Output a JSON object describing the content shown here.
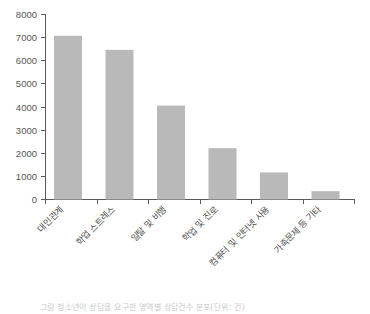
{
  "chart_data": {
    "type": "bar",
    "title": "",
    "subtitle": "",
    "xlabel": "",
    "ylabel": "",
    "ylim": [
      0,
      8000
    ],
    "ytick_labels": [
      "8000",
      "7000",
      "6000",
      "5000",
      "4000",
      "3000",
      "2000",
      "1000",
      "0"
    ],
    "ytick_values": [
      8000,
      7000,
      6000,
      5000,
      4000,
      3000,
      2000,
      1000,
      0
    ],
    "grid": false,
    "legend": null,
    "categories": [
      "대인관계",
      "학업 스트레스",
      "일탈 및 비행",
      "학업 및 진로",
      "컴퓨터 및 인터넷 사용",
      "가족문제 등 기타"
    ],
    "values": [
      7080,
      6470,
      4060,
      2220,
      1170,
      360
    ],
    "bar_color": "#b9b9b9",
    "axis_color": "#5a5a5a",
    "background_color": "#ffffff"
  },
  "caption": {
    "text": "그림   청소년이 상담을 요구한 영역별 상담건수 분포(단위: 건)"
  }
}
